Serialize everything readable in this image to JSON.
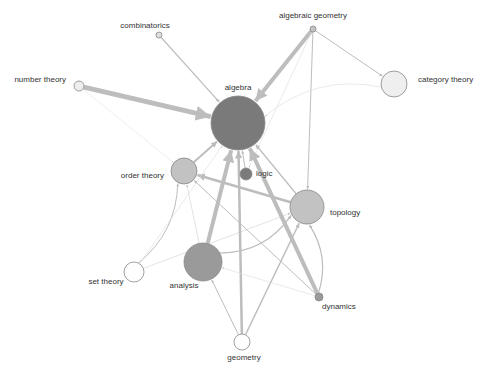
{
  "diagram": {
    "type": "directed-network-graph",
    "nodes": [
      {
        "id": "algebra",
        "label": "algebra",
        "x": 238,
        "y": 123,
        "r": 27,
        "fill": "#7a7a7a",
        "label_x": 238,
        "label_y": 90,
        "anchor": "middle"
      },
      {
        "id": "algebraic_geometry",
        "label": "algebraic geometry",
        "x": 313,
        "y": 29,
        "r": 3,
        "fill": "#c4c4c4",
        "label_x": 313,
        "label_y": 18,
        "anchor": "middle"
      },
      {
        "id": "combinatorics",
        "label": "combinatorics",
        "x": 159,
        "y": 35,
        "r": 3,
        "fill": "#dedede",
        "label_x": 145,
        "label_y": 28,
        "anchor": "middle"
      },
      {
        "id": "number_theory",
        "label": "number theory",
        "x": 79,
        "y": 86,
        "r": 5,
        "fill": "#eeeeee",
        "label_x": 66,
        "label_y": 82,
        "anchor": "end"
      },
      {
        "id": "category_theory",
        "label": "category theory",
        "x": 394,
        "y": 84,
        "r": 13,
        "fill": "#efefef",
        "label_x": 418,
        "label_y": 82,
        "anchor": "start"
      },
      {
        "id": "order_theory",
        "label": "order theory",
        "x": 184,
        "y": 171,
        "r": 13,
        "fill": "#c2c2c2",
        "label_x": 164,
        "label_y": 178,
        "anchor": "end"
      },
      {
        "id": "logic",
        "label": "logic",
        "x": 246,
        "y": 174,
        "r": 6,
        "fill": "#7a7a7a",
        "label_x": 256,
        "label_y": 176,
        "anchor": "start"
      },
      {
        "id": "topology",
        "label": "topology",
        "x": 307,
        "y": 207,
        "r": 17,
        "fill": "#c2c2c2",
        "label_x": 330,
        "label_y": 215,
        "anchor": "start"
      },
      {
        "id": "analysis",
        "label": "analysis",
        "x": 203,
        "y": 262,
        "r": 19,
        "fill": "#9a9a9a",
        "label_x": 184,
        "label_y": 288,
        "anchor": "middle"
      },
      {
        "id": "set_theory",
        "label": "set theory",
        "x": 134,
        "y": 272,
        "r": 10,
        "fill": "#ffffff",
        "label_x": 106,
        "label_y": 284,
        "anchor": "middle"
      },
      {
        "id": "geometry",
        "label": "geometry",
        "x": 242,
        "y": 342,
        "r": 8,
        "fill": "#ffffff",
        "label_x": 244,
        "label_y": 360,
        "anchor": "middle"
      },
      {
        "id": "dynamics",
        "label": "dynamics",
        "x": 319,
        "y": 297,
        "r": 4,
        "fill": "#9a9a9a",
        "label_x": 322,
        "label_y": 309,
        "anchor": "start"
      }
    ],
    "edges": [
      {
        "source": "number_theory",
        "target": "algebra",
        "weight": 5
      },
      {
        "source": "combinatorics",
        "target": "algebra",
        "weight": 1.2
      },
      {
        "source": "algebraic_geometry",
        "target": "algebra",
        "weight": 4
      },
      {
        "source": "algebraic_geometry",
        "target": "category_theory",
        "weight": 1
      },
      {
        "source": "algebraic_geometry",
        "target": "topology",
        "weight": 1
      },
      {
        "source": "algebraic_geometry",
        "target": "logic",
        "weight": 0.6
      },
      {
        "source": "category_theory",
        "target": "algebra",
        "weight": 0.6,
        "curve": true
      },
      {
        "source": "order_theory",
        "target": "algebra",
        "weight": 2
      },
      {
        "source": "logic",
        "target": "algebra",
        "weight": 1
      },
      {
        "source": "topology",
        "target": "algebra",
        "weight": 1.5
      },
      {
        "source": "topology",
        "target": "order_theory",
        "weight": 2.5
      },
      {
        "source": "analysis",
        "target": "algebra",
        "weight": 4
      },
      {
        "source": "analysis",
        "target": "topology",
        "weight": 1.2,
        "curve": true
      },
      {
        "source": "set_theory",
        "target": "order_theory",
        "weight": 1,
        "curve": true
      },
      {
        "source": "set_theory",
        "target": "topology",
        "weight": 0.8
      },
      {
        "source": "set_theory",
        "target": "algebra",
        "weight": 0.6
      },
      {
        "source": "geometry",
        "target": "algebra",
        "weight": 2.5
      },
      {
        "source": "geometry",
        "target": "analysis",
        "weight": 1
      },
      {
        "source": "geometry",
        "target": "topology",
        "weight": 1.5
      },
      {
        "source": "dynamics",
        "target": "algebra",
        "weight": 4
      },
      {
        "source": "dynamics",
        "target": "topology",
        "weight": 1.2,
        "curve": true
      },
      {
        "source": "dynamics",
        "target": "order_theory",
        "weight": 1
      },
      {
        "source": "dynamics",
        "target": "analysis",
        "weight": 0.6
      },
      {
        "source": "analysis",
        "target": "order_theory",
        "weight": 0.8
      },
      {
        "source": "number_theory",
        "target": "order_theory",
        "weight": 0.5
      }
    ]
  }
}
